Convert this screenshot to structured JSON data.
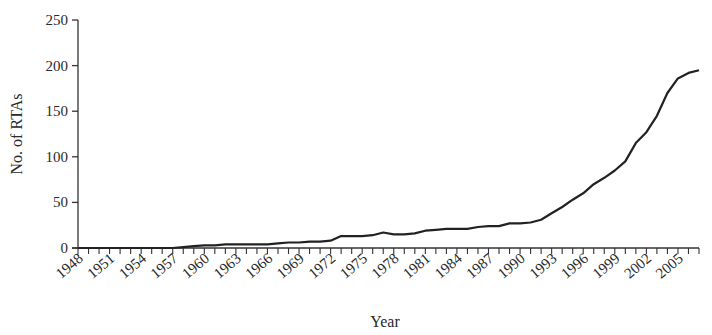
{
  "chart_data": {
    "type": "line",
    "title": "",
    "xlabel": "Year",
    "ylabel": "No. of RTAs",
    "ylim": [
      0,
      250
    ],
    "yticks": [
      0,
      50,
      100,
      150,
      200,
      250
    ],
    "xtick_labels": [
      "1948",
      "1951",
      "1954",
      "1957",
      "1960",
      "1963",
      "1966",
      "1969",
      "1972",
      "1975",
      "1978",
      "1981",
      "1984",
      "1987",
      "1990",
      "1993",
      "1996",
      "1999",
      "2002",
      "2005"
    ],
    "grid": false,
    "legend": null,
    "series": [
      {
        "name": "No. of RTAs",
        "color": "#222222",
        "x": [
          1948,
          1949,
          1950,
          1951,
          1952,
          1953,
          1954,
          1955,
          1956,
          1957,
          1958,
          1959,
          1960,
          1961,
          1962,
          1963,
          1964,
          1965,
          1966,
          1967,
          1968,
          1969,
          1970,
          1971,
          1972,
          1973,
          1974,
          1975,
          1976,
          1977,
          1978,
          1979,
          1980,
          1981,
          1982,
          1983,
          1984,
          1985,
          1986,
          1987,
          1988,
          1989,
          1990,
          1991,
          1992,
          1993,
          1994,
          1995,
          1996,
          1997,
          1998,
          1999,
          2000,
          2001,
          2002,
          2003,
          2004,
          2005,
          2006,
          2007
        ],
        "values": [
          0,
          0,
          0,
          0,
          0,
          0,
          0,
          0,
          0,
          0,
          1,
          2,
          3,
          3,
          4,
          4,
          4,
          4,
          4,
          5,
          6,
          6,
          7,
          7,
          8,
          13,
          13,
          13,
          14,
          17,
          15,
          15,
          16,
          19,
          20,
          21,
          21,
          21,
          23,
          24,
          24,
          27,
          27,
          28,
          31,
          38,
          45,
          53,
          60,
          70,
          77,
          85,
          95,
          115,
          127,
          145,
          170,
          186,
          192,
          195
        ]
      }
    ]
  }
}
